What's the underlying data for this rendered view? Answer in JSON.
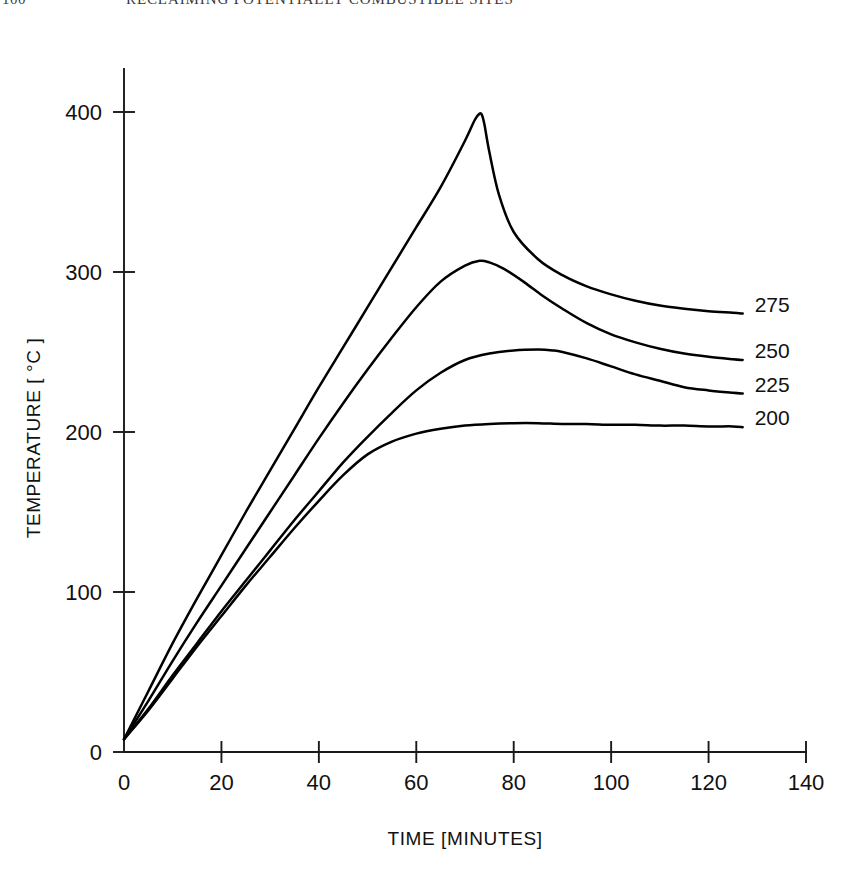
{
  "page": {
    "folio": "100",
    "running_title": "RECLAIMING POTENTIALLY COMBUSTIBLE SITES"
  },
  "chart_data": {
    "type": "line",
    "title": "",
    "xlabel": "TIME [MINUTES]",
    "ylabel": "TEMPERATURE [ °C ]",
    "xlim": [
      0,
      140
    ],
    "ylim": [
      0,
      420
    ],
    "xticks": [
      0,
      20,
      40,
      60,
      80,
      100,
      120,
      140
    ],
    "yticks": [
      0,
      100,
      200,
      300,
      400
    ],
    "xtick_labels": [
      "0",
      "20",
      "40",
      "60",
      "80",
      "100",
      "120",
      "140"
    ],
    "ytick_labels": [
      "0",
      "100",
      "200",
      "300",
      "400"
    ],
    "grid": false,
    "legend_position": "right-inline-end-labels",
    "series": [
      {
        "name": "275",
        "label": "275",
        "label_value": 275,
        "x": [
          0,
          5,
          10,
          15,
          20,
          25,
          30,
          35,
          40,
          45,
          50,
          55,
          60,
          65,
          70,
          72,
          73,
          73.5,
          74,
          75,
          77,
          80,
          85,
          90,
          95,
          100,
          105,
          110,
          115,
          120,
          125,
          127
        ],
        "y": [
          8,
          38,
          68,
          96,
          123,
          150,
          176,
          202,
          228,
          253,
          278,
          303,
          328,
          353,
          382,
          395,
          399,
          398,
          392,
          375,
          348,
          325,
          308,
          298,
          291,
          286,
          282,
          279,
          277,
          275.5,
          274.5,
          274
        ]
      },
      {
        "name": "250",
        "label": "250",
        "label_value": 250,
        "x": [
          0,
          5,
          10,
          15,
          20,
          25,
          30,
          35,
          40,
          45,
          50,
          55,
          60,
          65,
          70,
          73,
          75,
          78,
          82,
          86,
          90,
          95,
          100,
          105,
          110,
          115,
          120,
          125,
          127
        ],
        "y": [
          8,
          32,
          57,
          81,
          104,
          127,
          150,
          173,
          196,
          218,
          239,
          259,
          278,
          294,
          304,
          307,
          306,
          302,
          294,
          285,
          277,
          268,
          261,
          256,
          252,
          249,
          247,
          245.5,
          245
        ]
      },
      {
        "name": "225",
        "label": "225",
        "label_value": 225,
        "x": [
          0,
          5,
          10,
          15,
          20,
          25,
          30,
          35,
          40,
          45,
          50,
          55,
          60,
          65,
          70,
          75,
          80,
          85,
          88,
          90,
          95,
          100,
          105,
          110,
          115,
          120,
          125,
          127
        ],
        "y": [
          8,
          27,
          48,
          68,
          88,
          107,
          126,
          145,
          163,
          181,
          197,
          212,
          226,
          237,
          245,
          249,
          251,
          251.5,
          251,
          250,
          246,
          241,
          236,
          232,
          228,
          226,
          224.5,
          224
        ]
      },
      {
        "name": "200",
        "label": "200",
        "label_value": 200,
        "x": [
          0,
          5,
          10,
          15,
          20,
          25,
          30,
          35,
          40,
          45,
          50,
          55,
          60,
          65,
          70,
          75,
          80,
          85,
          90,
          95,
          100,
          105,
          110,
          115,
          120,
          125,
          127
        ],
        "y": [
          8,
          26,
          46,
          66,
          85,
          104,
          122,
          140,
          157,
          173,
          186,
          194,
          199,
          202,
          204,
          205,
          205.5,
          205.5,
          205,
          205,
          204.5,
          204.5,
          204,
          204,
          203.5,
          203.5,
          203
        ]
      }
    ]
  }
}
